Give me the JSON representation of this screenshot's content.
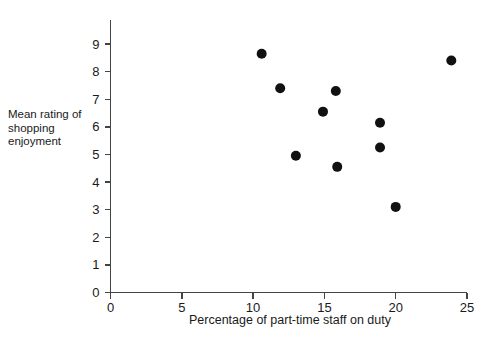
{
  "chart_data": {
    "type": "scatter",
    "title": "",
    "xlabel": "Percentage of part-time staff on duty",
    "ylabel": "Mean rating of shopping enjoyment",
    "xlim": [
      0,
      25
    ],
    "ylim": [
      0,
      9
    ],
    "xticks": [
      0,
      5,
      10,
      15,
      20,
      25
    ],
    "yticks": [
      0,
      1,
      2,
      3,
      4,
      5,
      6,
      7,
      8,
      9
    ],
    "xtick_labels": [
      "0",
      "5",
      "10",
      "15",
      "20",
      "25"
    ],
    "ytick_labels": [
      "0",
      "1",
      "2",
      "3",
      "4",
      "5",
      "6",
      "7",
      "8",
      "9"
    ],
    "grid": false,
    "legend": false,
    "marker": "filled-circle",
    "marker_color": "#111111",
    "marker_size": 9,
    "points": [
      {
        "x": 10.6,
        "y": 8.65
      },
      {
        "x": 11.9,
        "y": 7.4
      },
      {
        "x": 13.0,
        "y": 4.95
      },
      {
        "x": 14.9,
        "y": 6.55
      },
      {
        "x": 15.8,
        "y": 7.3
      },
      {
        "x": 15.9,
        "y": 4.55
      },
      {
        "x": 18.9,
        "y": 6.15
      },
      {
        "x": 18.9,
        "y": 5.25
      },
      {
        "x": 20.0,
        "y": 3.1
      },
      {
        "x": 23.9,
        "y": 8.4
      }
    ]
  },
  "labels": {
    "ylabel_line1": "Mean rating of",
    "ylabel_line2": "shopping",
    "ylabel_line3": "enjoyment",
    "xlabel": "Percentage of part-time staff on duty"
  }
}
